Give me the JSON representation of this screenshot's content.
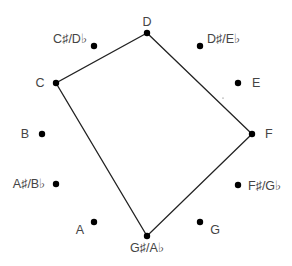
{
  "diagram": {
    "title": "",
    "type": "chromatic-circle",
    "colors": {
      "dot": "#000000",
      "line": "#222222",
      "label": "#444444",
      "background": "#ffffff"
    },
    "notes": [
      {
        "id": "C",
        "label": "C",
        "x": 56,
        "y": 83,
        "lx": 40,
        "ly": 87,
        "anchor": "middle"
      },
      {
        "id": "Cs",
        "label": "C♯/D♭",
        "x": 94,
        "y": 46,
        "lx": 70,
        "ly": 43,
        "anchor": "middle"
      },
      {
        "id": "D",
        "label": "D",
        "x": 147,
        "y": 33,
        "lx": 147,
        "ly": 26,
        "anchor": "middle"
      },
      {
        "id": "Ds",
        "label": "D♯/E♭",
        "x": 200,
        "y": 46,
        "lx": 207,
        "ly": 43,
        "anchor": "start"
      },
      {
        "id": "E",
        "label": "E",
        "x": 238,
        "y": 83,
        "lx": 252,
        "ly": 87,
        "anchor": "start"
      },
      {
        "id": "F",
        "label": "F",
        "x": 252,
        "y": 134,
        "lx": 265,
        "ly": 138,
        "anchor": "start"
      },
      {
        "id": "Fs",
        "label": "F♯/G♭",
        "x": 238,
        "y": 185,
        "lx": 248,
        "ly": 190,
        "anchor": "start"
      },
      {
        "id": "G",
        "label": "G",
        "x": 200,
        "y": 222,
        "lx": 215,
        "ly": 234,
        "anchor": "middle"
      },
      {
        "id": "Gs",
        "label": "G♯/A♭",
        "x": 147,
        "y": 236,
        "lx": 147,
        "ly": 252,
        "anchor": "middle"
      },
      {
        "id": "A",
        "label": "A",
        "x": 94,
        "y": 222,
        "lx": 80,
        "ly": 234,
        "anchor": "middle"
      },
      {
        "id": "As",
        "label": "A♯/B♭",
        "x": 56,
        "y": 184,
        "lx": 29,
        "ly": 188,
        "anchor": "middle"
      },
      {
        "id": "B",
        "label": "B",
        "x": 42,
        "y": 134,
        "lx": 25,
        "ly": 138,
        "anchor": "middle"
      }
    ],
    "polygon": [
      "D",
      "F",
      "Gs",
      "C"
    ],
    "polygon_label": "D – F – G♯/A♭ – C",
    "stray_mark": {
      "x": 223,
      "y": 98
    }
  }
}
